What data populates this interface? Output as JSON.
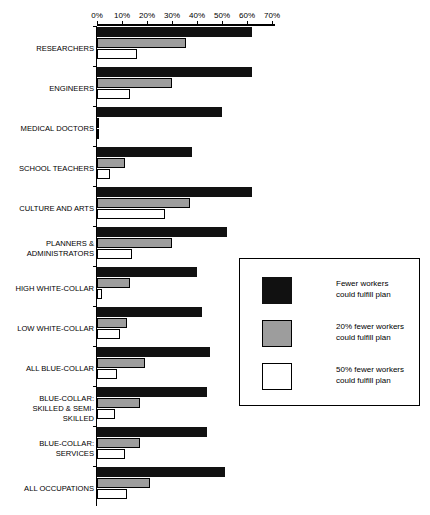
{
  "chart_data": {
    "type": "bar",
    "title": "",
    "subtitle": "",
    "xlabel": "",
    "ylabel": "",
    "orientation": "horizontal",
    "xlim": [
      0,
      70
    ],
    "xtick_labels": [
      "0%",
      "10%",
      "20%",
      "30%",
      "40%",
      "50%",
      "60%",
      "70%"
    ],
    "xticks": [
      0,
      10,
      20,
      30,
      40,
      50,
      60,
      70
    ],
    "grid": false,
    "legend_position": "middle-right",
    "categories": [
      "RESEARCHERS",
      "ENGINEERS",
      "MEDICAL DOCTORS",
      "SCHOOL TEACHERS",
      "CULTURE AND ARTS",
      "PLANNERS &\nADMINISTRATORS",
      "HIGH WHITE-COLLAR",
      "LOW WHITE-COLLAR",
      "ALL BLUE-COLLAR",
      "BLUE-COLLAR:\nSKILLED & SEMI-\nSKILLED",
      "BLUE-COLLAR:\nSERVICES",
      "ALL OCCUPATIONS"
    ],
    "series": [
      {
        "name": "Fewer workers\ncould fulfill plan",
        "color": "#111111",
        "values": [
          62,
          62,
          50,
          38,
          62,
          52,
          40,
          42,
          45,
          44,
          44,
          51
        ]
      },
      {
        "name": "20% fewer workers\ncould fulfill plan",
        "color": "#9d9d9d",
        "values": [
          35.5,
          30,
          0,
          11,
          37,
          30,
          13,
          12,
          19,
          17,
          17,
          21
        ]
      },
      {
        "name": "50% fewer workers\ncould fulfill plan",
        "color": "#ffffff",
        "values": [
          16,
          13,
          0,
          5,
          27,
          14,
          2,
          9,
          8,
          7,
          11,
          12
        ]
      }
    ]
  },
  "legend": {
    "entries": [
      {
        "label": "Fewer workers\ncould fulfill plan",
        "swatch": "black"
      },
      {
        "label": "20% fewer workers\ncould fulfill plan",
        "swatch": "gray"
      },
      {
        "label": "50% fewer workers\ncould fulfill plan",
        "swatch": "white"
      }
    ]
  }
}
